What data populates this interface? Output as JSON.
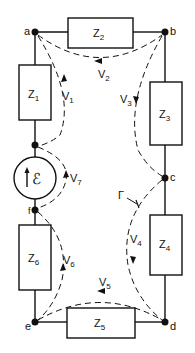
{
  "diagram": {
    "type": "circuit",
    "nodes": [
      {
        "id": "a",
        "label": "a",
        "x": 35,
        "y": 32
      },
      {
        "id": "b",
        "label": "b",
        "x": 165,
        "y": 32
      },
      {
        "id": "c",
        "label": "c",
        "x": 165,
        "y": 178
      },
      {
        "id": "d",
        "label": "d",
        "x": 165,
        "y": 322
      },
      {
        "id": "e",
        "label": "e",
        "x": 35,
        "y": 322
      },
      {
        "id": "f",
        "label": "f",
        "x": 35,
        "y": 210
      },
      {
        "id": "g",
        "label": "",
        "x": 35,
        "y": 145
      }
    ],
    "impedances": [
      {
        "id": "Z1",
        "label": "Z",
        "sub": "1"
      },
      {
        "id": "Z2",
        "label": "Z",
        "sub": "2"
      },
      {
        "id": "Z3",
        "label": "Z",
        "sub": "3"
      },
      {
        "id": "Z4",
        "label": "Z",
        "sub": "4"
      },
      {
        "id": "Z5",
        "label": "Z",
        "sub": "5"
      },
      {
        "id": "Z6",
        "label": "Z",
        "sub": "6"
      }
    ],
    "source": {
      "label": "ℰ",
      "arrow": "up"
    },
    "voltages": [
      {
        "id": "V1",
        "label": "V",
        "sub": "1"
      },
      {
        "id": "V2",
        "label": "V",
        "sub": "2"
      },
      {
        "id": "V3",
        "label": "V",
        "sub": "3"
      },
      {
        "id": "V4",
        "label": "V",
        "sub": "4"
      },
      {
        "id": "V5",
        "label": "V",
        "sub": "5"
      },
      {
        "id": "V6",
        "label": "V",
        "sub": "6"
      },
      {
        "id": "V7",
        "label": "V",
        "sub": "7"
      }
    ],
    "path_label": "Γ",
    "colors": {
      "ink": "#111111",
      "background": "#ffffff"
    }
  }
}
